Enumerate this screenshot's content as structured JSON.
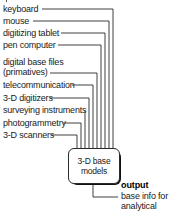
{
  "diagram": {
    "type": "flowchart",
    "inputs": [
      {
        "label": "keyboard",
        "text_top": 4,
        "line_y": 9,
        "line_start_x": 42,
        "drop_x": 113
      },
      {
        "label": "mouse",
        "text_top": 16,
        "line_y": 21,
        "line_start_x": 33,
        "drop_x": 109
      },
      {
        "label": "digitizing tablet",
        "text_top": 28,
        "line_y": 33,
        "line_start_x": 61,
        "drop_x": 105
      },
      {
        "label": "pen computer",
        "text_top": 40,
        "line_y": 45,
        "line_start_x": 58,
        "drop_x": 101
      },
      {
        "label": "digital base files",
        "text_top": 58,
        "line_y": 73,
        "line_start_x": 50,
        "drop_x": 97,
        "second_line": "(primatives)"
      },
      {
        "label": "telecommunication",
        "text_top": 80,
        "line_y": 85,
        "line_start_x": 72,
        "drop_x": 93
      },
      {
        "label": "3-D digitizers",
        "text_top": 93,
        "line_y": 98,
        "line_start_x": 50,
        "drop_x": 89
      },
      {
        "label": "surveying instruments",
        "text_top": 106,
        "line_y": 111,
        "line_start_x": 85,
        "drop_x": 85
      },
      {
        "label": "photogrammetry",
        "text_top": 118,
        "line_y": 123,
        "line_start_x": 63,
        "drop_x": 81
      },
      {
        "label": "3-D scanners",
        "text_top": 130,
        "line_y": 135,
        "line_start_x": 51,
        "drop_x": 77
      }
    ],
    "node": {
      "line1": "3-D base",
      "line2": "models"
    },
    "output": {
      "title": "output",
      "description": "base info for analytical models"
    },
    "colors": {
      "line": "#2b2b2b",
      "text": "#1a1a1a",
      "shadow": "#111111",
      "background": "#ffffff"
    }
  }
}
